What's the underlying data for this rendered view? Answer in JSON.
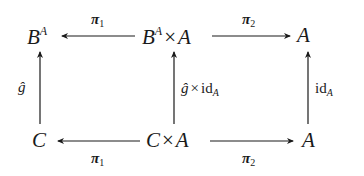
{
  "diagram": {
    "type": "commutative-diagram",
    "nodes": {
      "top_left": {
        "base": "B",
        "sup": "A"
      },
      "top_mid": {
        "base": "B",
        "sup": "A",
        "times": "×",
        "right": "A"
      },
      "top_right": {
        "base": "A"
      },
      "bot_left": {
        "base": "C"
      },
      "bot_mid": {
        "base": "C",
        "times": "×",
        "right": "A"
      },
      "bot_right": {
        "base": "A"
      }
    },
    "edges": {
      "top_pi1": {
        "label": "π",
        "sub": "1",
        "from": "top_mid",
        "to": "top_left"
      },
      "top_pi2": {
        "label": "π",
        "sub": "2",
        "from": "top_mid",
        "to": "top_right"
      },
      "bot_pi1": {
        "label": "π",
        "sub": "1",
        "from": "bot_mid",
        "to": "bot_left"
      },
      "bot_pi2": {
        "label": "π",
        "sub": "2",
        "from": "bot_mid",
        "to": "bot_right"
      },
      "left_vert": {
        "label": "ĝ",
        "from": "bot_left",
        "to": "top_left"
      },
      "mid_vert": {
        "label": "ĝ",
        "times": "×",
        "id": "id",
        "sub": "A",
        "from": "bot_mid",
        "to": "top_mid"
      },
      "right_vert": {
        "id": "id",
        "sub": "A",
        "from": "bot_right",
        "to": "top_right"
      }
    }
  }
}
